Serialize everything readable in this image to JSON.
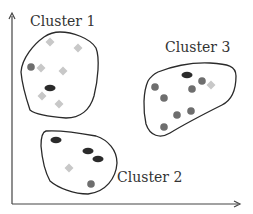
{
  "diagram": {
    "type": "cluster-scatter",
    "colors": {
      "axis": "#444444",
      "outline": "#2a2a2a",
      "dark_ellipse": "#2b2b2b",
      "gray_circle": "#6e6e6e",
      "light_diamond": "#c8c8c8",
      "label": "#333333"
    },
    "axes": {
      "x_arrow": true,
      "y_arrow": true
    },
    "clusters": [
      {
        "id": "cluster-1",
        "label": "Cluster 1",
        "points": [
          {
            "shape": "diamond",
            "x": 50,
            "y": 42
          },
          {
            "shape": "diamond",
            "x": 78,
            "y": 48
          },
          {
            "shape": "circle",
            "x": 31,
            "y": 67
          },
          {
            "shape": "diamond",
            "x": 41,
            "y": 68
          },
          {
            "shape": "diamond",
            "x": 63,
            "y": 71
          },
          {
            "shape": "ellipse",
            "x": 50,
            "y": 88
          },
          {
            "shape": "diamond",
            "x": 42,
            "y": 96
          },
          {
            "shape": "diamond",
            "x": 59,
            "y": 104
          }
        ]
      },
      {
        "id": "cluster-2",
        "label": "Cluster 2",
        "points": [
          {
            "shape": "ellipse",
            "x": 56,
            "y": 140
          },
          {
            "shape": "ellipse",
            "x": 88,
            "y": 151
          },
          {
            "shape": "ellipse",
            "x": 98,
            "y": 159
          },
          {
            "shape": "diamond",
            "x": 69,
            "y": 168
          },
          {
            "shape": "circle",
            "x": 91,
            "y": 184
          }
        ]
      },
      {
        "id": "cluster-3",
        "label": "Cluster 3",
        "points": [
          {
            "shape": "ellipse",
            "x": 187,
            "y": 75
          },
          {
            "shape": "circle",
            "x": 202,
            "y": 81
          },
          {
            "shape": "diamond",
            "x": 211,
            "y": 85
          },
          {
            "shape": "circle",
            "x": 155,
            "y": 87
          },
          {
            "shape": "circle",
            "x": 192,
            "y": 89
          },
          {
            "shape": "circle",
            "x": 164,
            "y": 98
          },
          {
            "shape": "circle",
            "x": 191,
            "y": 111
          },
          {
            "shape": "circle",
            "x": 177,
            "y": 115
          },
          {
            "shape": "circle",
            "x": 164,
            "y": 127
          }
        ]
      }
    ]
  }
}
